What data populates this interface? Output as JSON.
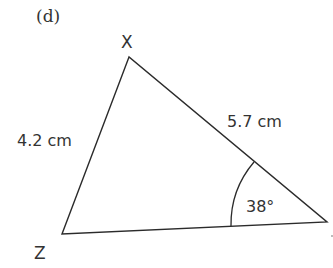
{
  "figure": {
    "part_label": "(d)",
    "vertices": {
      "top": {
        "label": "X"
      },
      "bottom_left": {
        "label": "Z"
      },
      "right": {
        "label": ""
      }
    },
    "sides": {
      "XZ": {
        "label": "4.2 cm"
      },
      "XY": {
        "label": "5.7 cm"
      }
    },
    "angle": {
      "label": "38°",
      "at": "right vertex"
    },
    "line_color": "#2b2b2b",
    "text_color": "#333333"
  }
}
